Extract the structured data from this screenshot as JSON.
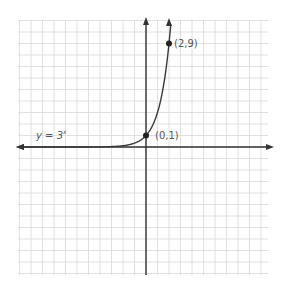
{
  "chart_data": {
    "type": "line",
    "title": "",
    "function_label": "y = 3ˣ",
    "xlabel": "",
    "ylabel": "",
    "xlim": [
      -11,
      10
    ],
    "ylim": [
      -11,
      11
    ],
    "grid": true,
    "series": [
      {
        "name": "y = 3^x",
        "x": [
          -11,
          -6,
          -4,
          -3,
          -2,
          -1,
          0,
          0.5,
          1,
          1.5,
          2,
          2.2
        ],
        "values": [
          5.6e-06,
          0.0014,
          0.012,
          0.037,
          0.111,
          0.333,
          1,
          1.732,
          3,
          5.196,
          9,
          11.2
        ]
      }
    ],
    "points": [
      {
        "x": 0,
        "y": 1,
        "label": "(0,1)"
      },
      {
        "x": 2,
        "y": 9,
        "label": "(2,9)"
      }
    ]
  },
  "labels": {
    "function": "y = 3",
    "exponent": "x",
    "point_a": "(0,1)",
    "point_b": "(2,9)"
  },
  "colors": {
    "grid": "#d6d6d6",
    "axis": "#333333",
    "curve": "#3a3a3a",
    "point": "#222222",
    "text": "#555555"
  }
}
